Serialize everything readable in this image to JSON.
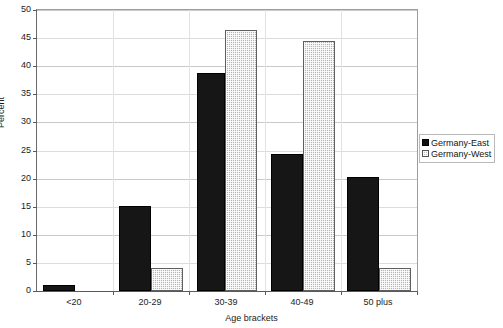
{
  "chart_data": {
    "type": "bar",
    "title": "",
    "xlabel": "Age brackets",
    "ylabel": "Percent",
    "categories": [
      "<20",
      "20-29",
      "30-39",
      "40-49",
      "50 plus"
    ],
    "series": [
      {
        "name": "Germany-East",
        "color": "#161616",
        "values": [
          1.0,
          15.2,
          38.8,
          24.4,
          20.2
        ]
      },
      {
        "name": "Germany-West",
        "color": "#b4b4b4",
        "values": [
          0.0,
          4.1,
          46.5,
          44.5,
          4.1
        ]
      }
    ],
    "ylim": [
      0,
      50
    ],
    "yticks": [
      0,
      5,
      10,
      15,
      20,
      25,
      30,
      35,
      40,
      45,
      50
    ],
    "ytick_labels": [
      "0",
      "5",
      "10",
      "15",
      "20",
      "25",
      "30",
      "35",
      "40",
      "45",
      "50"
    ],
    "grid": true,
    "grid_axis": "y",
    "legend_position": "right",
    "legend_entries": [
      "Germany-East",
      "Germany-West"
    ]
  },
  "axes": {
    "y_title": "Percent",
    "x_title": "Age brackets"
  },
  "artifact": {
    "clipped_title_row": ""
  }
}
